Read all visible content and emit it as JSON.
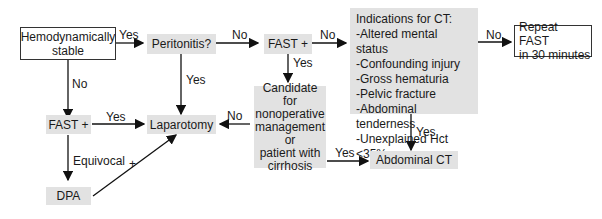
{
  "nodes": {
    "hemo": {
      "line1": "Hemodynamically",
      "line2": "stable"
    },
    "peritonitis": {
      "label": "Peritonitis?"
    },
    "fast_top": {
      "label": "FAST +"
    },
    "ct_indications": {
      "title": "Indications for CT:",
      "items": [
        "-Altered mental status",
        "-Confounding injury",
        "-Gross hematuria",
        "-Pelvic fracture",
        "-Abdominal tenderness",
        "-Unexplained Hct <35%"
      ]
    },
    "repeat_fast": {
      "line1": "Repeat FAST",
      "line2": "in 30 minutes"
    },
    "candidate": {
      "lines": [
        "Candidate for",
        "nonoperative",
        "management",
        "or",
        "patient with",
        "cirrhosis"
      ]
    },
    "fast_left": {
      "label": "FAST +"
    },
    "laparotomy": {
      "label": "Laparotomy"
    },
    "abdominal_ct": {
      "label": "Abdominal CT"
    },
    "dpa": {
      "label": "DPA"
    }
  },
  "edges": {
    "hemo_peritonitis": "Yes",
    "hemo_fast": "No",
    "peritonitis_fast": "No",
    "peritonitis_lap": "Yes",
    "fast_ct": "No",
    "fast_candidate": "Yes",
    "ct_repeat": "No",
    "ct_abdct": "Yes",
    "candidate_lap": "No",
    "candidate_abdct": "Yes",
    "fastleft_lap": "Yes",
    "fastleft_dpa": "Equivocal",
    "dpa_lap": "+"
  }
}
